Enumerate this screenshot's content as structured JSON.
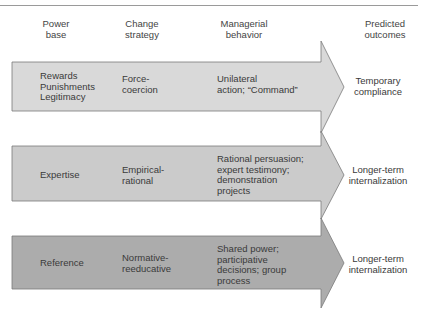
{
  "headers": {
    "power_base": [
      "Power",
      "base"
    ],
    "change_strategy": [
      "Change",
      "strategy"
    ],
    "managerial_behavior": [
      "Managerial",
      "behavior"
    ],
    "predicted_outcomes": [
      "Predicted",
      "outcomes"
    ]
  },
  "rows": [
    {
      "fill": "#d9d9d9",
      "power_base": [
        "Rewards",
        "Punishments",
        "Legitimacy"
      ],
      "change_strategy": [
        "Force-",
        "coercion"
      ],
      "managerial_behavior": [
        "Unilateral",
        "action; “Command”"
      ],
      "predicted_outcome": [
        "Temporary",
        "compliance"
      ]
    },
    {
      "fill": "#cbcbcb",
      "power_base": [
        "Expertise"
      ],
      "change_strategy": [
        "Empirical-",
        "rational"
      ],
      "managerial_behavior": [
        "Rational persuasion;",
        "expert testimony;",
        "demonstration",
        "projects"
      ],
      "predicted_outcome": [
        "Longer-term",
        "internalization"
      ]
    },
    {
      "fill": "#acacac",
      "power_base": [
        "Reference"
      ],
      "change_strategy": [
        "Normative-",
        "reeducative"
      ],
      "managerial_behavior": [
        "Shared power;",
        "participative",
        "decisions; group",
        "process"
      ],
      "predicted_outcome": [
        "Longer-term",
        "internalization"
      ]
    }
  ],
  "colors": {
    "stroke": "#7a7a7a",
    "rule": "#9a9a9a"
  }
}
